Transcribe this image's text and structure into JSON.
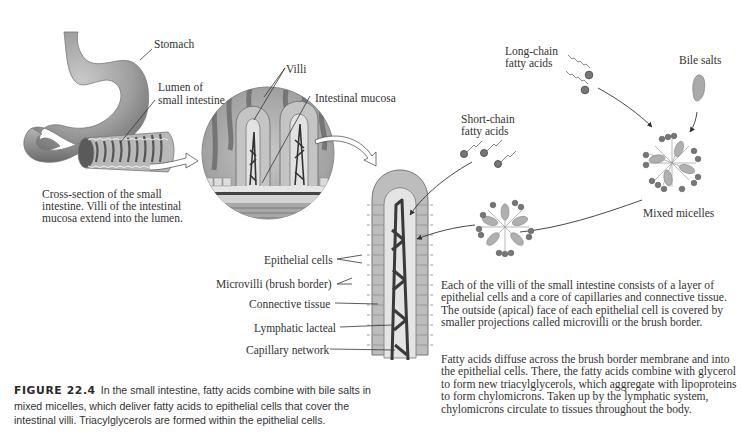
{
  "figure": {
    "number": "FIGURE 22.4",
    "caption": "In the small intestine, fatty acids combine with bile salts in mixed micelles, which deliver fatty acids to epithelial cells that cover the intestinal villi. Triacylglycerols are formed within the epithelial cells."
  },
  "labels": {
    "stomach": "Stomach",
    "lumen_line1": "Lumen of",
    "lumen_line2": "small intestine",
    "villi": "Villi",
    "intestinal_mucosa": "Intestinal mucosa",
    "cross_section_line1": "Cross-section of the small",
    "cross_section_line2": "intestine. Villi of the intestinal",
    "cross_section_line3": "mucosa extend into the lumen.",
    "epithelial_cells": "Epithelial cells",
    "microvilli": "Microvilli (brush border)",
    "connective_tissue": "Connective tissue",
    "lymphatic_lacteal": "Lymphatic lacteal",
    "capillary_network": "Capillary network",
    "short_chain_line1": "Short-chain",
    "short_chain_line2": "fatty acids",
    "long_chain_line1": "Long-chain",
    "long_chain_line2": "fatty acids",
    "bile_salts": "Bile salts",
    "mixed_micelles": "Mixed micelles"
  },
  "description": {
    "paragraph1": "Each of the villi of the small intestine consists of a layer of epithelial cells and a core of capillaries and connective tissue. The outside (apical) face of each epithelial cell is covered by smaller projections called microvilli or the brush border.",
    "paragraph2": "Fatty acids diffuse across the brush border membrane and into the epithelial cells. There, the fatty acids combine with glycerol to form new triacylglycerols, which aggregate with lipoproteins to form chylomicrons. Taken up by the lymphatic system, chylomicrons circulate to tissues throughout the body."
  },
  "colors": {
    "ink": "#333333",
    "illustration_gray": "#9a9a9a",
    "capillary_dark": "#3a3a3a"
  }
}
